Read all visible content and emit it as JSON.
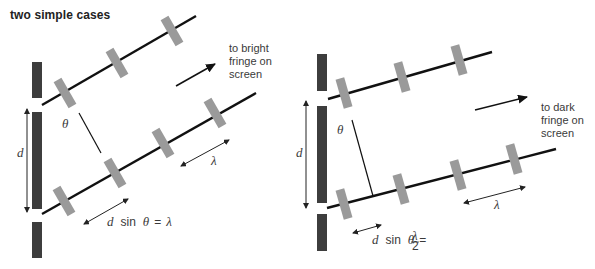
{
  "title": "two simple cases",
  "colors": {
    "barrier": "#3d3d3d",
    "ray": "#111111",
    "wavefront": "#9a9a9a",
    "label": "#3a3a3a"
  },
  "left_case": {
    "direction_label": [
      "to bright",
      "fringe on",
      "screen"
    ],
    "slit_separation_label": "d",
    "angle_label": "θ",
    "wavelength_label": "λ",
    "path_difference_label": {
      "d": "d",
      "sin": "sin",
      "theta": "θ",
      "equals": "=",
      "rhs": "λ"
    }
  },
  "right_case": {
    "direction_label": [
      "to dark",
      "fringe on",
      "screen"
    ],
    "slit_separation_label": "d",
    "angle_label": "θ",
    "wavelength_label": "λ",
    "path_difference_label": {
      "d": "d",
      "sin": "sin",
      "theta": "θ",
      "equals": "=",
      "rhs_numerator": "λ",
      "rhs_denominator": "2"
    }
  }
}
